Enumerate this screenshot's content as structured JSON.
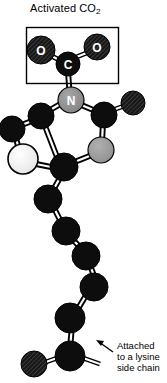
{
  "figure": {
    "type": "molecular-structure-diagram",
    "background_color": "#ffffff",
    "width": 167,
    "height": 383
  },
  "annotations": {
    "activated_co2": {
      "text_main": "Activated CO",
      "text_sub": "2",
      "full_text": "Activated CO2"
    },
    "lysine": {
      "line1": "Attached",
      "line2": "to a lysine",
      "line3": "side chain"
    }
  },
  "atom_labels": {
    "carbon_co2": "C",
    "oxygen_left": "O",
    "oxygen_right": "O",
    "nitrogen": "N"
  },
  "colors": {
    "carbon_black": "#0d0d0d",
    "oxygen_textured": "#1a1a1a",
    "nitrogen_gray": "#8a8a8a",
    "sulfur_light": "#ededed",
    "carbon_mid_gray": "#9a9a9a",
    "outline": "#000000",
    "bond_fill": "#ffffff",
    "label_text": "#000000",
    "atom_text": "#ffffff"
  },
  "box": {
    "name": "activated-co2-callout-box",
    "x": 26,
    "y": 27,
    "width": 92,
    "height": 56,
    "stroke": "#000000"
  },
  "arrow": {
    "name": "lysine-pointer-arrow",
    "from_x": 113,
    "from_y": 352,
    "to_x": 96,
    "to_y": 340
  }
}
